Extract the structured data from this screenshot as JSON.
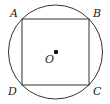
{
  "diagram": {
    "colors": {
      "stroke": "#333333",
      "text": "#222222",
      "background": "#ffffff"
    },
    "circle": {
      "center_label": "O",
      "cx": 55.5,
      "cy": 52,
      "r": 47
    },
    "square": {
      "vertices": [
        {
          "label": "A",
          "x": 22,
          "y": 19
        },
        {
          "label": "B",
          "x": 89,
          "y": 19
        },
        {
          "label": "C",
          "x": 89,
          "y": 85
        },
        {
          "label": "D",
          "x": 22,
          "y": 85
        }
      ]
    },
    "labels": {
      "A": "A",
      "B": "B",
      "C": "C",
      "D": "D",
      "O": "O"
    }
  }
}
